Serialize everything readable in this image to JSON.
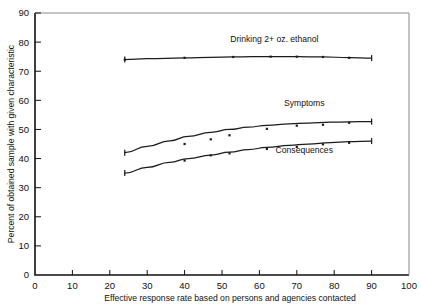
{
  "chart_data": {
    "type": "line",
    "title": "",
    "subtitle": "",
    "xlabel": "Effective response rate based on persons and agencies contacted",
    "ylabel": "Percent of obtained sample with given characteristic",
    "xlim": [
      0,
      100
    ],
    "ylim": [
      0,
      90
    ],
    "xticks": [
      0,
      10,
      20,
      30,
      40,
      50,
      60,
      70,
      80,
      90,
      100
    ],
    "yticks": [
      0,
      10,
      20,
      30,
      40,
      50,
      60,
      70,
      80,
      90
    ],
    "xtick_labels": [
      "0",
      "10",
      "20",
      "30",
      "40",
      "50",
      "60",
      "70",
      "80",
      "90",
      "100"
    ],
    "ytick_labels": [
      "0",
      "10",
      "20",
      "30",
      "40",
      "50",
      "60",
      "70",
      "80",
      "90"
    ],
    "grid": false,
    "legend_position": "inline-right-of-series",
    "series": [
      {
        "name": "Drinking 2+ oz. ethanol",
        "label": "Drinking 2+ oz. ethanol",
        "label_x": 64,
        "label_y": 80,
        "x": [
          24,
          30,
          40,
          47,
          53,
          58,
          63,
          70,
          77,
          84,
          90
        ],
        "y": [
          74.0,
          74.3,
          74.6,
          74.8,
          74.9,
          75.0,
          75.0,
          75.0,
          74.9,
          74.7,
          74.5
        ],
        "points": [
          {
            "x": 24,
            "y": 74.0
          },
          {
            "x": 40,
            "y": 74.6
          },
          {
            "x": 53,
            "y": 74.9
          },
          {
            "x": 63,
            "y": 75.0
          },
          {
            "x": 70,
            "y": 75.0
          },
          {
            "x": 77,
            "y": 74.9
          },
          {
            "x": 84,
            "y": 74.6
          }
        ]
      },
      {
        "name": "Symptoms",
        "label": "Symptoms",
        "label_x": 72,
        "label_y": 58,
        "x": [
          24,
          30,
          36,
          41,
          47,
          52,
          57,
          62,
          68,
          73,
          79,
          84,
          90
        ],
        "y": [
          42.0,
          44.2,
          46.1,
          47.6,
          49.0,
          50.0,
          50.8,
          51.4,
          51.9,
          52.2,
          52.5,
          52.6,
          52.7
        ],
        "points": [
          {
            "x": 40,
            "y": 45.0
          },
          {
            "x": 47,
            "y": 46.6
          },
          {
            "x": 52,
            "y": 48.0
          },
          {
            "x": 62,
            "y": 50.2
          },
          {
            "x": 70,
            "y": 51.3
          },
          {
            "x": 77,
            "y": 51.6
          },
          {
            "x": 84,
            "y": 52.3
          }
        ]
      },
      {
        "name": "Consequences",
        "label": "Consequences",
        "label_x": 72,
        "label_y": 42,
        "x": [
          24,
          30,
          36,
          41,
          47,
          52,
          57,
          62,
          68,
          73,
          79,
          84,
          90
        ],
        "y": [
          35.0,
          37.0,
          38.7,
          40.0,
          41.2,
          42.2,
          43.1,
          43.8,
          44.5,
          45.0,
          45.5,
          45.8,
          46.0
        ],
        "points": [
          {
            "x": 40,
            "y": 39.3
          },
          {
            "x": 47,
            "y": 41.1
          },
          {
            "x": 52,
            "y": 41.8
          },
          {
            "x": 62,
            "y": 43.3
          },
          {
            "x": 70,
            "y": 44.0
          },
          {
            "x": 77,
            "y": 44.9
          },
          {
            "x": 84,
            "y": 45.4
          }
        ]
      }
    ]
  },
  "axes": {
    "x_title": "Effective response rate based on persons and agencies contacted",
    "y_title": "Percent of obtained sample with given characteristic"
  }
}
